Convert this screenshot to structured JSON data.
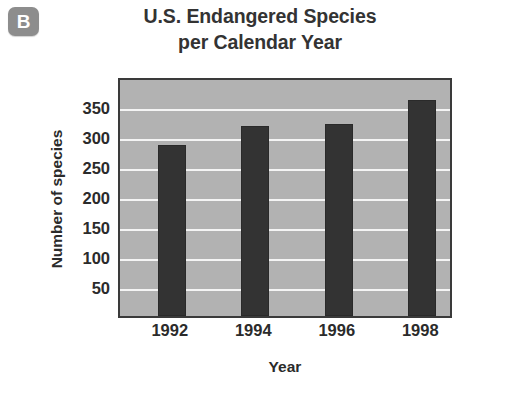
{
  "badge": {
    "label": "B",
    "icon": "panel-letter-badge",
    "color": "#8d8d8d"
  },
  "title": {
    "line1": "U.S. Endangered Species",
    "line2": "per Calendar Year",
    "full": "U.S. Endangered Species per Calendar Year"
  },
  "chart_data": {
    "type": "bar",
    "title": "U.S. Endangered Species per Calendar Year",
    "subtitle": "",
    "categories": [
      "1992",
      "1994",
      "1996",
      "1998"
    ],
    "values": [
      285,
      317,
      320,
      360
    ],
    "xlabel": "Year",
    "ylabel": "Number of species",
    "ylim": [
      0,
      400
    ],
    "yticks": [
      50,
      100,
      150,
      200,
      250,
      300,
      350
    ],
    "ytick_labels": [
      "50",
      "100",
      "150",
      "200",
      "250",
      "300",
      "350"
    ],
    "xtick_labels": [
      "1992",
      "1994",
      "1996",
      "1998"
    ],
    "grid": true,
    "grid_orientation": "horizontal",
    "grid_color": "#f4f4f4",
    "legend": null,
    "legend_position": "none",
    "bar_color": "#333333",
    "plot_background": "#b2b2b2",
    "annotations": []
  }
}
